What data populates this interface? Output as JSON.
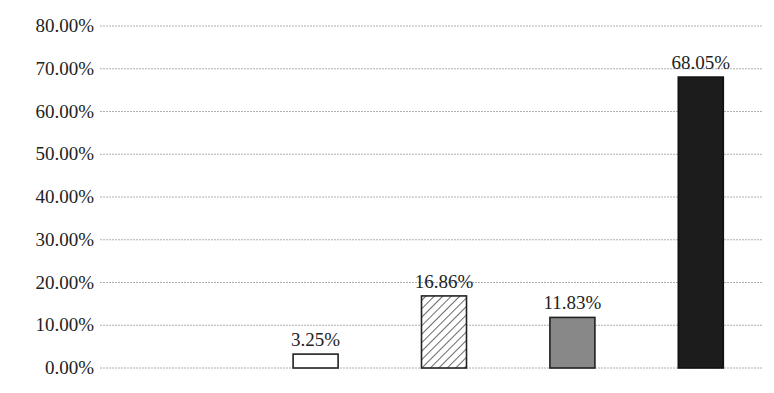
{
  "chart_data": {
    "type": "bar",
    "title": "",
    "title_note": "Title text is cropped at top edge; illegible",
    "xlabel": "",
    "ylabel": "",
    "ylim": [
      0,
      80
    ],
    "y_ticks": [
      "0.00%",
      "10.00%",
      "20.00%",
      "30.00%",
      "40.00%",
      "50.00%",
      "60.00%",
      "70.00%",
      "80.00%"
    ],
    "grid": true,
    "legend": null,
    "categories": [
      "",
      "",
      "",
      "",
      ""
    ],
    "values": [
      null,
      3.25,
      16.86,
      11.83,
      68.05
    ],
    "data_labels": [
      "",
      "3.25%",
      "16.86%",
      "11.83%",
      "68.05%"
    ],
    "bar_styles": [
      {
        "fill": "none",
        "pattern": "none",
        "stroke": "#222222"
      },
      {
        "fill": "#ffffff",
        "pattern": "none",
        "stroke": "#222222"
      },
      {
        "fill": "#ffffff",
        "pattern": "diagonal-hatch",
        "stroke": "#222222"
      },
      {
        "fill": "#888888",
        "pattern": "none",
        "stroke": "#222222"
      },
      {
        "fill": "#1c1c1c",
        "pattern": "none",
        "stroke": "#111111"
      }
    ]
  },
  "colors": {
    "grid": "#b0b0b0",
    "text": "#222222"
  }
}
